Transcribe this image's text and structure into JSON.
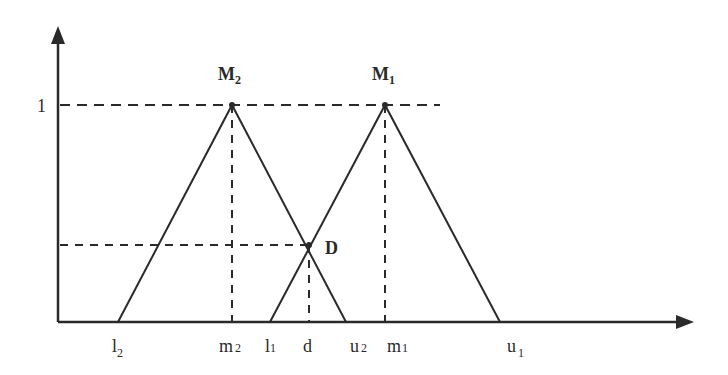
{
  "diagram": {
    "type": "fuzzy-triangular-membership-comparison",
    "colors": {
      "stroke": "#2a2a2a",
      "background": "#ffffff"
    },
    "y_axis": {
      "label_one": "1"
    },
    "peaks": [
      {
        "id": "M2",
        "label": "M",
        "subscript": "2"
      },
      {
        "id": "M1",
        "label": "M",
        "subscript": "1"
      }
    ],
    "intersection": {
      "label": "D"
    },
    "x_ticks": [
      {
        "id": "l2",
        "label": "l",
        "subscript": "2"
      },
      {
        "id": "m2",
        "label": "m",
        "subscript": "2"
      },
      {
        "id": "l1",
        "label": "l",
        "subscript": "1"
      },
      {
        "id": "d",
        "label": "d",
        "subscript": ""
      },
      {
        "id": "u2",
        "label": "u",
        "subscript": "2"
      },
      {
        "id": "m1",
        "label": "m",
        "subscript": "1"
      },
      {
        "id": "u1",
        "label": "u",
        "subscript": "1"
      }
    ]
  }
}
